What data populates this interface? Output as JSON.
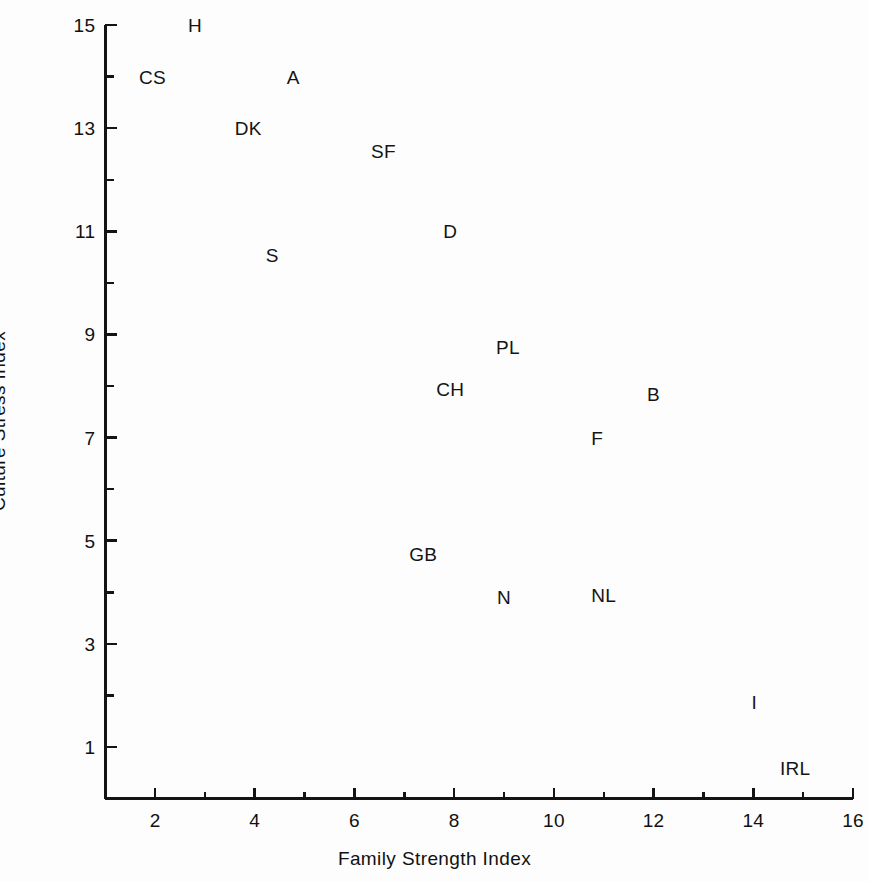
{
  "figure": {
    "background_color": "#fdfdfd",
    "ink_color": "#141414"
  },
  "chart_data": {
    "type": "scatter",
    "title": "",
    "xlabel": "Family Strength Index",
    "ylabel": "Culture Stress Index",
    "xlim": [
      1,
      16
    ],
    "ylim": [
      0,
      15
    ],
    "grid": false,
    "legend_position": "none",
    "marker_style": "text-label",
    "x_major_ticks": [
      2,
      4,
      6,
      8,
      10,
      12,
      14,
      16
    ],
    "x_minor_ticks": [
      1,
      3,
      5,
      7,
      9,
      11,
      13,
      15
    ],
    "x_tick_labels": [
      "2",
      "4",
      "6",
      "8",
      "10",
      "12",
      "14",
      "16"
    ],
    "y_major_ticks": [
      1,
      3,
      5,
      7,
      9,
      11,
      13,
      15
    ],
    "y_minor_ticks": [
      2,
      4,
      6,
      8,
      10,
      12,
      14
    ],
    "y_tick_labels": [
      "1",
      "3",
      "5",
      "7",
      "9",
      "11",
      "13",
      "15"
    ],
    "points": [
      {
        "label": "H",
        "x": 2.8,
        "y": 15.0
      },
      {
        "label": "CS",
        "x": 1.95,
        "y": 14.0
      },
      {
        "label": "A",
        "x": 4.77,
        "y": 14.0
      },
      {
        "label": "DK",
        "x": 3.87,
        "y": 13.0
      },
      {
        "label": "SF",
        "x": 6.58,
        "y": 12.55
      },
      {
        "label": "D",
        "x": 7.92,
        "y": 11.0
      },
      {
        "label": "S",
        "x": 4.35,
        "y": 10.55
      },
      {
        "label": "PL",
        "x": 9.08,
        "y": 8.75
      },
      {
        "label": "CH",
        "x": 7.92,
        "y": 7.95
      },
      {
        "label": "B",
        "x": 12.0,
        "y": 7.85
      },
      {
        "label": "F",
        "x": 10.87,
        "y": 7.0
      },
      {
        "label": "GB",
        "x": 7.38,
        "y": 4.75
      },
      {
        "label": "N",
        "x": 9.0,
        "y": 3.9
      },
      {
        "label": "NL",
        "x": 11.0,
        "y": 3.95
      },
      {
        "label": "I",
        "x": 14.02,
        "y": 1.87
      },
      {
        "label": "IRL",
        "x": 14.84,
        "y": 0.6
      }
    ]
  },
  "axis_geometry": {
    "x_pixel_at_zero": 55.3,
    "x_pixels_per_unit": 49.86,
    "y_pixel_at_zero": 798.6,
    "y_pixels_per_unit": 51.57,
    "x_axis_start_value": 1,
    "x_axis_end_value": 16,
    "y_axis_start_value": 0.1,
    "y_axis_end_value": 15
  }
}
